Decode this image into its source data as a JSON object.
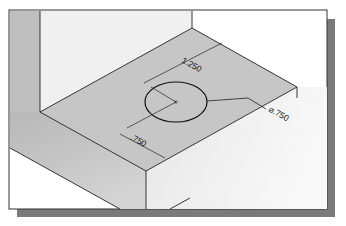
{
  "figure": {
    "type": "isometric-drawing",
    "dimensions": {
      "hole_x_offset": "1.250",
      "hole_y_offset": ".750",
      "hole_diameter": "⌀.750"
    },
    "colors": {
      "top_face": "#c4c4c4",
      "side_face_left": "#b8b8b8",
      "vertical_face": "#f1f1f1",
      "front_face": "#ececec",
      "frame_shadow": "#7a7a7a",
      "line": "#222222"
    }
  }
}
